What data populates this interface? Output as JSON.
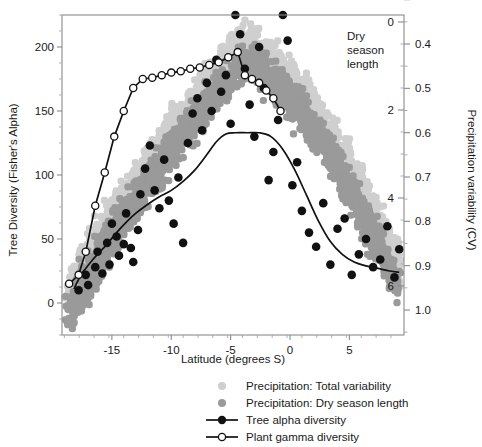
{
  "chart_data": {
    "type": "scatter",
    "title": "",
    "xlabel": "Latitude (degrees S)",
    "ylabel": "Tree Diversity (Fisher's Alpha)",
    "y2label": "Precipitation variability (CV)",
    "inner_axis_label": "Dry season length",
    "xlim": [
      -19.2,
      9.6
    ],
    "ylim": [
      -25,
      225
    ],
    "xticks": [
      -15,
      -10,
      -5,
      0,
      5
    ],
    "xtick_labels": [
      "-15",
      "-10",
      "-5",
      "0",
      "5"
    ],
    "yticks": [
      0,
      50,
      100,
      150,
      200
    ],
    "ytick_labels": [
      "0",
      "50",
      "100",
      "150",
      "200"
    ],
    "y2ticks_cv": [
      0.4,
      0.5,
      0.6,
      0.7,
      0.8,
      0.9,
      1.0
    ],
    "y2tick_labels_cv": [
      "0.4",
      "0.5",
      "0.6",
      "0.7",
      "0.8",
      "0.9",
      "1.0"
    ],
    "dry_season_ticks": [
      0,
      2,
      4,
      6
    ],
    "dry_season_tick_labels": [
      "0",
      "2",
      "4",
      "6"
    ],
    "grid": false,
    "legend_position": "bottom-right",
    "colors": {
      "total_variability": "#cfcfcf",
      "dry_season_length": "#9a9a9a",
      "tree_alpha": "#111111",
      "gamma_open_marker_fill": "#ffffff",
      "axis": "#8a8a8a"
    },
    "legend": [
      {
        "label": "Precipitation: Total variability",
        "marker": "dot-light",
        "color": "#cfcfcf"
      },
      {
        "label": "Precipitation: Dry season length",
        "marker": "dot-dark",
        "color": "#9a9a9a"
      },
      {
        "label": "Tree alpha diversity",
        "marker": "line-filled-circle",
        "color": "#111111"
      },
      {
        "label": "Plant gamma diversity",
        "marker": "line-open-circle",
        "color": "#111111"
      }
    ],
    "series": [
      {
        "name": "Tree alpha diversity",
        "type": "line+markers",
        "marker": "filled-circle",
        "x": [
          -18.2,
          -17.6,
          -17.2,
          -16.6,
          -16.0,
          -15.4,
          -14.6,
          -13.8,
          -13.0,
          -12.0,
          -11.0,
          -10.0,
          -9.0,
          -8.0,
          -7.0,
          -6.2,
          -5.4,
          -4.6,
          -3.6,
          -2.6,
          -1.6,
          -0.6,
          0.4,
          1.4,
          2.4,
          3.4,
          4.4,
          5.4,
          6.4,
          7.4,
          8.4,
          9.2
        ],
        "y": [
          11,
          22,
          27,
          34,
          40,
          46,
          55,
          63,
          70,
          77,
          83,
          88,
          95,
          104,
          116,
          126,
          132,
          133,
          133,
          133,
          130,
          120,
          104,
          84,
          64,
          48,
          38,
          32,
          29,
          27,
          25,
          24
        ]
      },
      {
        "name": "Plant gamma diversity",
        "type": "line+markers",
        "marker": "open-circle",
        "x": [
          -18.6,
          -17.8,
          -17.2,
          -16.4,
          -15.6,
          -14.8,
          -14.0,
          -13.2,
          -12.4,
          -11.6,
          -10.8,
          -10.0,
          -9.2,
          -8.4,
          -7.6,
          -6.8,
          -6.0,
          -5.2,
          -4.4,
          -3.8,
          -3.2,
          -2.6,
          -2.0,
          -1.4,
          -0.8
        ],
        "y": [
          15,
          22,
          40,
          76,
          102,
          130,
          150,
          168,
          175,
          176,
          178,
          180,
          181,
          183,
          184,
          186,
          188,
          192,
          196,
          178,
          175,
          172,
          166,
          160,
          150
        ]
      },
      {
        "name": "Precipitation: Total variability",
        "type": "scatter-cloud",
        "marker": "square-light",
        "note": "light gray point cloud, CV axis (right), rises from SW to peak near -4 then falls to SE"
      },
      {
        "name": "Precipitation: Dry season length",
        "type": "scatter-cloud",
        "marker": "square-dark",
        "note": "dark gray point cloud, dry season length axis (inner right), overlaps total variability cloud"
      }
    ],
    "scatter_alpha_points": {
      "name": "Tree alpha diversity observations",
      "x": [
        -17.8,
        -17.2,
        -17.0,
        -16.4,
        -16.2,
        -15.8,
        -15.4,
        -15.2,
        -15.0,
        -14.6,
        -14.4,
        -14.0,
        -13.8,
        -13.4,
        -13.2,
        -12.8,
        -12.6,
        -12.2,
        -11.8,
        -11.4,
        -11.0,
        -10.6,
        -10.2,
        -9.8,
        -9.4,
        -9.0,
        -8.6,
        -8.2,
        -7.8,
        -7.4,
        -7.0,
        -6.6,
        -6.2,
        -5.8,
        -5.4,
        -5.0,
        -4.6,
        -4.2,
        -3.8,
        -3.4,
        -3.0,
        -2.6,
        -2.2,
        -1.8,
        -1.4,
        -1.0,
        -0.6,
        -0.2,
        0.2,
        0.6,
        1.0,
        1.6,
        2.2,
        2.8,
        3.4,
        4.0,
        4.6,
        5.2,
        5.8,
        6.4,
        7.0,
        7.6,
        8.2,
        8.8,
        9.2
      ],
      "y": [
        10,
        22,
        14,
        28,
        40,
        23,
        47,
        30,
        62,
        52,
        37,
        46,
        70,
        43,
        32,
        57,
        85,
        105,
        123,
        88,
        74,
        112,
        80,
        62,
        98,
        47,
        125,
        148,
        160,
        135,
        172,
        150,
        190,
        165,
        178,
        140,
        225,
        210,
        183,
        155,
        130,
        200,
        168,
        96,
        118,
        143,
        225,
        205,
        92,
        110,
        72,
        55,
        44,
        78,
        30,
        58,
        66,
        22,
        38,
        50,
        28,
        34,
        60,
        20,
        42
      ]
    }
  },
  "figure": {
    "width": 482,
    "height": 447
  }
}
